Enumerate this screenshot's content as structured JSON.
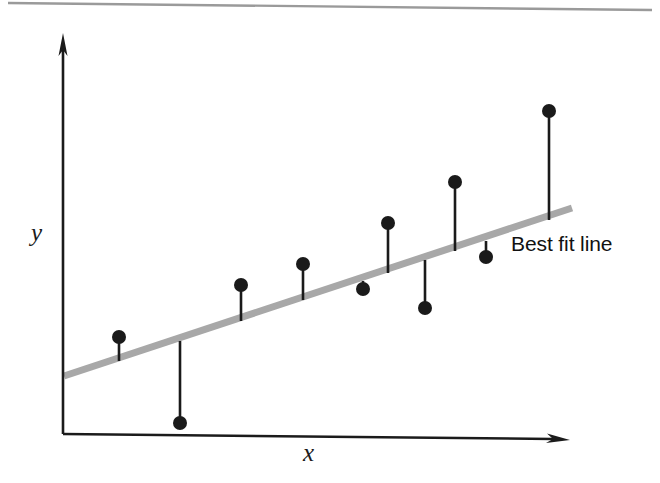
{
  "figure": {
    "title": "",
    "background_color": "#ffffff",
    "top_rule_color": "#9a9a9a"
  },
  "labels": {
    "y_axis": "y",
    "x_axis": "x",
    "best_fit": "Best fit line"
  },
  "colors": {
    "axis": "#1b1b1b",
    "best_fit_line": "#a8a8a8",
    "point_fill": "#1a1a1a",
    "residual_stem": "#1a1a1a"
  },
  "chart_data": {
    "type": "scatter",
    "title": "",
    "xlabel": "x",
    "ylabel": "y",
    "grid": false,
    "legend": "none",
    "annotations": [
      {
        "text": "Best fit line",
        "x": 511,
        "y": 247
      }
    ],
    "axes_px": {
      "y_axis_x": 63,
      "y_axis_top": 38,
      "x_axis_y": 434,
      "x_axis_right": 568,
      "origin": [
        63,
        434
      ]
    },
    "best_fit_line": {
      "x0_px": 64,
      "y0_px": 376,
      "x1_px": 572,
      "y1_px": 208,
      "stroke_width_px": 7,
      "color": "#a8a8a8"
    },
    "points_px": [
      {
        "id": 1,
        "x": 119,
        "y": 337,
        "line_y": 361,
        "side": "above"
      },
      {
        "id": 2,
        "x": 180,
        "y": 423,
        "line_y": 341,
        "side": "below"
      },
      {
        "id": 3,
        "x": 241,
        "y": 285,
        "line_y": 321,
        "side": "above"
      },
      {
        "id": 4,
        "x": 303,
        "y": 264,
        "line_y": 300,
        "side": "above"
      },
      {
        "id": 5,
        "x": 363,
        "y": 289,
        "line_y": 281,
        "side": "below"
      },
      {
        "id": 6,
        "x": 388,
        "y": 223,
        "line_y": 273,
        "side": "above"
      },
      {
        "id": 7,
        "x": 425,
        "y": 308,
        "line_y": 260,
        "side": "below"
      },
      {
        "id": 8,
        "x": 455,
        "y": 182,
        "line_y": 251,
        "side": "above"
      },
      {
        "id": 9,
        "x": 486,
        "y": 257,
        "line_y": 241,
        "side": "below"
      },
      {
        "id": 10,
        "x": 549,
        "y": 111,
        "line_y": 220,
        "side": "above"
      }
    ],
    "point_radius_px": 7,
    "n_points": 10
  }
}
